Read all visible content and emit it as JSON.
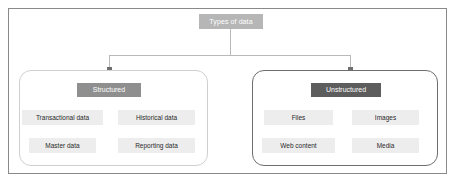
{
  "diagram": {
    "root": {
      "label": "Types of data"
    },
    "branches": [
      {
        "id": "structured",
        "header": "Structured",
        "leaves": [
          "Transactional data",
          "Historical data",
          "Master data",
          "Reporting data"
        ]
      },
      {
        "id": "unstructured",
        "header": "Unstructured",
        "leaves": [
          "Files",
          "Images",
          "Web content",
          "Media"
        ]
      }
    ],
    "colors": {
      "frame_border": "#8a8a8a",
      "root_fill": "#b6b6b6",
      "structured_header_fill": "#8f8f8f",
      "unstructured_header_fill": "#5d5d5d",
      "structured_group_border": "#cfcfcf",
      "unstructured_group_border": "#6e6e6e",
      "leaf_fill": "#ededed",
      "connector": "#b9b9b9",
      "arrow": "#6f6f6f",
      "background": "#ffffff"
    }
  }
}
